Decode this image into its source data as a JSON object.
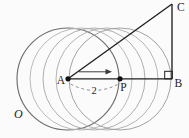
{
  "figure": {
    "kind": "geometry-translation-diagram",
    "background_color": "#fbfbfb",
    "ink_color": "#1f1f1f",
    "width": 189,
    "height": 138,
    "circles": {
      "radius": 51,
      "cy": 79,
      "cx_list": [
        68,
        81,
        94,
        107,
        120
      ],
      "stroke_colors": [
        "#6e6e6e",
        "#b6b6b6",
        "#aaaaaa",
        "#b0b0b0",
        "#9e9e9e"
      ],
      "label": "O",
      "label_x": 14,
      "label_y": 117.5
    },
    "points": [
      {
        "id": "A",
        "label": "A",
        "x": 68,
        "y": 78.8,
        "dot": true,
        "label_x": 65,
        "label_y": 83.5,
        "anchor": "end"
      },
      {
        "id": "P",
        "label": "P",
        "x": 120,
        "y": 78.8,
        "dot": true,
        "label_x": 123.5,
        "label_y": 91,
        "anchor": "middle"
      },
      {
        "id": "B",
        "label": "B",
        "x": 172,
        "y": 78.8,
        "dot": false,
        "label_x": 174.5,
        "label_y": 87,
        "anchor": "start"
      },
      {
        "id": "C",
        "label": "C",
        "x": 172,
        "y": 4,
        "dot": false,
        "label_x": 177,
        "label_y": 11,
        "anchor": "start"
      }
    ],
    "segments": [
      {
        "from": "A",
        "to": "B"
      },
      {
        "from": "B",
        "to": "C"
      },
      {
        "from": "A",
        "to": "C"
      }
    ],
    "right_angle_marker": {
      "at": "B",
      "x": 164.7,
      "y": 71.3,
      "size": 7.5
    },
    "translation_arrow": {
      "x1": 79,
      "y1": 71.8,
      "x2": 112,
      "y2": 71.8,
      "color": "#3c3c3c"
    },
    "distance_marker": {
      "label": "2",
      "label_x": 94,
      "label_y": 94,
      "path": "M 70.5 84 Q 94 96.5 117.5 84.5",
      "color": "#8a8a8a",
      "dash": "3 2.8"
    }
  }
}
